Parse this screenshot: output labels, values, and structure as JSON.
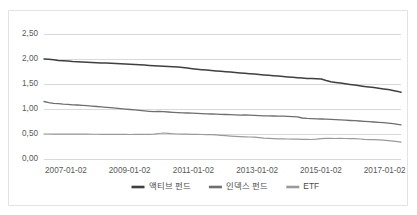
{
  "chart_data": {
    "type": "line",
    "title": "",
    "subtitle": "",
    "xlabel": "",
    "ylabel": "",
    "grid": true,
    "legend_position": "bottom",
    "ylim": [
      0.0,
      2.5
    ],
    "ytick_labels": [
      "2,50",
      "2,00",
      "1,50",
      "1,00",
      "0,50",
      "0,00"
    ],
    "ytick_values": [
      2.5,
      2.0,
      1.5,
      1.0,
      0.5,
      0.0
    ],
    "xtick_labels": [
      "2007-01-02",
      "2009-01-02",
      "2011-01-02",
      "2013-01-02",
      "2015-01-02",
      "2017-01-02"
    ],
    "xtick_values": [
      2007.0,
      2009.0,
      2011.0,
      2013.0,
      2015.0,
      2017.0
    ],
    "xlim": [
      2007.0,
      2018.2
    ],
    "series": [
      {
        "name": "액티브 펀드",
        "color": "#3f3f3f",
        "width": 1.5,
        "x": [
          2007.0,
          2007.15,
          2007.3,
          2007.45,
          2007.6,
          2007.75,
          2007.9,
          2008.05,
          2008.2,
          2008.35,
          2008.5,
          2008.65,
          2008.8,
          2008.95,
          2009.1,
          2009.25,
          2009.4,
          2009.55,
          2009.7,
          2009.85,
          2010.0,
          2010.15,
          2010.3,
          2010.45,
          2010.6,
          2010.75,
          2010.9,
          2011.05,
          2011.2,
          2011.35,
          2011.5,
          2011.65,
          2011.8,
          2011.95,
          2012.1,
          2012.25,
          2012.4,
          2012.55,
          2012.7,
          2012.85,
          2013.0,
          2013.15,
          2013.3,
          2013.45,
          2013.6,
          2013.75,
          2013.9,
          2014.05,
          2014.2,
          2014.35,
          2014.5,
          2014.65,
          2014.8,
          2014.95,
          2015.1,
          2015.25,
          2015.4,
          2015.55,
          2015.7,
          2015.85,
          2016.0,
          2016.15,
          2016.3,
          2016.45,
          2016.6,
          2016.75,
          2016.9,
          2017.05,
          2017.2,
          2017.35,
          2017.5,
          2017.65,
          2017.8,
          2017.95,
          2018.1,
          2018.2
        ],
        "y": [
          2.0,
          1.995,
          1.985,
          1.972,
          1.966,
          1.958,
          1.949,
          1.944,
          1.94,
          1.936,
          1.93,
          1.926,
          1.922,
          1.918,
          1.914,
          1.908,
          1.903,
          1.898,
          1.893,
          1.888,
          1.884,
          1.878,
          1.872,
          1.866,
          1.861,
          1.856,
          1.85,
          1.844,
          1.838,
          1.83,
          1.818,
          1.806,
          1.796,
          1.787,
          1.778,
          1.77,
          1.762,
          1.754,
          1.746,
          1.738,
          1.73,
          1.722,
          1.714,
          1.706,
          1.698,
          1.69,
          1.682,
          1.674,
          1.666,
          1.658,
          1.65,
          1.642,
          1.634,
          1.626,
          1.618,
          1.612,
          1.608,
          1.604,
          1.6,
          1.57,
          1.545,
          1.532,
          1.52,
          1.506,
          1.492,
          1.478,
          1.464,
          1.452,
          1.44,
          1.428,
          1.416,
          1.402,
          1.388,
          1.372,
          1.352,
          1.335
        ]
      },
      {
        "name": "인덱스 펀드",
        "color": "#6e6e6e",
        "width": 1.3,
        "x": [
          2007.0,
          2007.15,
          2007.3,
          2007.45,
          2007.6,
          2007.75,
          2007.9,
          2008.05,
          2008.2,
          2008.35,
          2008.5,
          2008.65,
          2008.8,
          2008.95,
          2009.1,
          2009.25,
          2009.4,
          2009.55,
          2009.7,
          2009.85,
          2010.0,
          2010.15,
          2010.3,
          2010.45,
          2010.6,
          2010.75,
          2010.9,
          2011.05,
          2011.2,
          2011.35,
          2011.5,
          2011.65,
          2011.8,
          2011.95,
          2012.1,
          2012.25,
          2012.4,
          2012.55,
          2012.7,
          2012.85,
          2013.0,
          2013.15,
          2013.3,
          2013.45,
          2013.6,
          2013.75,
          2013.9,
          2014.05,
          2014.2,
          2014.35,
          2014.5,
          2014.65,
          2014.8,
          2014.95,
          2015.1,
          2015.25,
          2015.4,
          2015.55,
          2015.7,
          2015.85,
          2016.0,
          2016.15,
          2016.3,
          2016.45,
          2016.6,
          2016.75,
          2016.9,
          2017.05,
          2017.2,
          2017.35,
          2017.5,
          2017.65,
          2017.8,
          2017.95,
          2018.1,
          2018.2
        ],
        "y": [
          1.15,
          1.128,
          1.112,
          1.108,
          1.098,
          1.094,
          1.084,
          1.08,
          1.072,
          1.066,
          1.058,
          1.05,
          1.042,
          1.034,
          1.026,
          1.018,
          1.008,
          0.998,
          0.99,
          0.982,
          0.972,
          0.962,
          0.954,
          0.948,
          0.952,
          0.946,
          0.94,
          0.934,
          0.928,
          0.924,
          0.92,
          0.916,
          0.912,
          0.908,
          0.904,
          0.9,
          0.896,
          0.892,
          0.89,
          0.886,
          0.882,
          0.878,
          0.88,
          0.876,
          0.872,
          0.868,
          0.864,
          0.862,
          0.86,
          0.858,
          0.856,
          0.852,
          0.848,
          0.844,
          0.82,
          0.812,
          0.808,
          0.804,
          0.8,
          0.796,
          0.792,
          0.788,
          0.782,
          0.776,
          0.77,
          0.766,
          0.76,
          0.752,
          0.746,
          0.74,
          0.734,
          0.726,
          0.716,
          0.706,
          0.692,
          0.682
        ]
      },
      {
        "name": "ETF",
        "color": "#9a9a9a",
        "width": 1.2,
        "x": [
          2007.0,
          2007.15,
          2007.3,
          2007.45,
          2007.6,
          2007.75,
          2007.9,
          2008.05,
          2008.2,
          2008.35,
          2008.5,
          2008.65,
          2008.8,
          2008.95,
          2009.1,
          2009.25,
          2009.4,
          2009.55,
          2009.7,
          2009.85,
          2010.0,
          2010.15,
          2010.3,
          2010.45,
          2010.6,
          2010.75,
          2010.9,
          2011.05,
          2011.2,
          2011.35,
          2011.5,
          2011.65,
          2011.8,
          2011.95,
          2012.1,
          2012.25,
          2012.4,
          2012.55,
          2012.7,
          2012.85,
          2013.0,
          2013.15,
          2013.3,
          2013.45,
          2013.6,
          2013.75,
          2013.9,
          2014.05,
          2014.2,
          2014.35,
          2014.5,
          2014.65,
          2014.8,
          2014.95,
          2015.1,
          2015.25,
          2015.4,
          2015.55,
          2015.7,
          2015.85,
          2016.0,
          2016.15,
          2016.3,
          2016.45,
          2016.6,
          2016.75,
          2016.9,
          2017.05,
          2017.2,
          2017.35,
          2017.5,
          2017.65,
          2017.8,
          2017.95,
          2018.1,
          2018.2
        ],
        "y": [
          0.5,
          0.5,
          0.499,
          0.499,
          0.498,
          0.498,
          0.497,
          0.497,
          0.496,
          0.496,
          0.495,
          0.495,
          0.494,
          0.494,
          0.493,
          0.492,
          0.492,
          0.491,
          0.49,
          0.492,
          0.494,
          0.493,
          0.492,
          0.496,
          0.51,
          0.52,
          0.512,
          0.505,
          0.5,
          0.498,
          0.496,
          0.494,
          0.492,
          0.49,
          0.488,
          0.486,
          0.482,
          0.474,
          0.466,
          0.458,
          0.452,
          0.448,
          0.444,
          0.44,
          0.436,
          0.428,
          0.418,
          0.412,
          0.408,
          0.404,
          0.402,
          0.4,
          0.398,
          0.396,
          0.394,
          0.392,
          0.39,
          0.396,
          0.408,
          0.414,
          0.412,
          0.41,
          0.412,
          0.41,
          0.408,
          0.406,
          0.4,
          0.392,
          0.388,
          0.386,
          0.382,
          0.376,
          0.368,
          0.358,
          0.346,
          0.338
        ]
      }
    ]
  },
  "legend": {
    "items": [
      {
        "label": "액티브 펀드"
      },
      {
        "label": "인덱스 펀드"
      },
      {
        "label": "ETF"
      }
    ]
  }
}
